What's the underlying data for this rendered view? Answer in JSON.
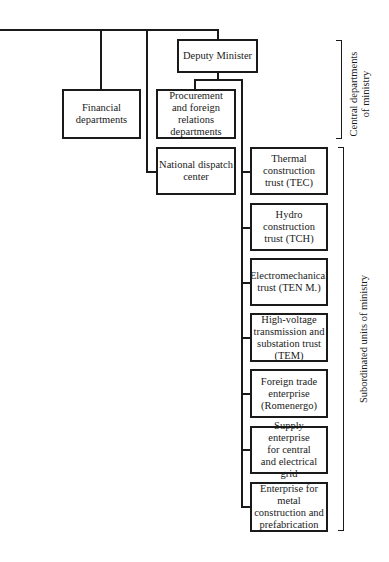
{
  "diagram": {
    "type": "org-chart",
    "nodes": {
      "deputy_minister": "Deputy Minister",
      "financial": "Financial\ndepartments",
      "procurement": "Procurement\nand foreign\nrelations\ndepartments",
      "national_dispatch": "National dispatch\ncenter",
      "thermal": "Thermal\nconstruction\ntrust (TEC)",
      "hydro": "Hydro\nconstruction\ntrust (TCH)",
      "electromechanical": "Electromechanical\ntrust (TEN M.)",
      "high_voltage": "High-voltage\ntransmission and\nsubstation trust\n(TEM)",
      "foreign_trade": "Foreign trade\nenterprise\n(Romenergo)",
      "supply": "Supply enterprise\nfor central\nand electrical grid",
      "metal": "Enterprise for\nmetal\nconstruction and\nprefabrication"
    },
    "groups": {
      "central": "Central departments\nof ministry",
      "subordinated": "Subordinated units of ministry"
    },
    "colors": {
      "ink": "#1a1a1a",
      "background": "#ffffff"
    }
  }
}
